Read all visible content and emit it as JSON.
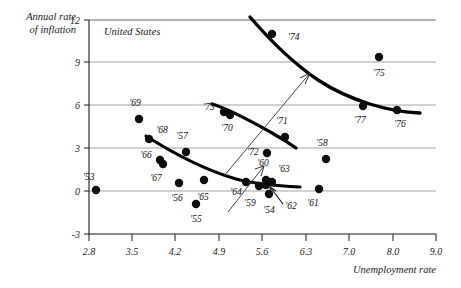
{
  "chart_data": {
    "type": "scatter",
    "title": "",
    "panel_label": "United States",
    "xlabel": "Unemployment rate",
    "ylabel_line1": "Annual rate",
    "ylabel_line2": "of inflation",
    "grid": true,
    "legend": "none",
    "ylim": [
      -3,
      12
    ],
    "yticks": [
      "12",
      "9",
      "6",
      "3",
      "0",
      "-3"
    ],
    "xticks": [
      "2.8",
      "3.5",
      "4.2",
      "4.9",
      "5.6",
      "6.3",
      "7.0",
      "8.0",
      "9.0"
    ],
    "xlim_note": "ticks evenly spaced in pixels though value steps change from 0.7 to 1.0 after 7.0",
    "point_label_key": "year",
    "points": [
      {
        "year": "'53",
        "x": 2.9,
        "y": 0.8,
        "px": 96,
        "py": 190,
        "lx": 83,
        "ly": 180,
        "anchor": "start"
      },
      {
        "year": "'54",
        "x": 5.6,
        "y": 0.5,
        "px": 269,
        "py": 194,
        "lx": 269,
        "ly": 213,
        "anchor": "middle"
      },
      {
        "year": "'55",
        "x": 4.4,
        "y": -0.4,
        "px": 196,
        "py": 204,
        "lx": 196,
        "ly": 222,
        "anchor": "middle"
      },
      {
        "year": "'56",
        "x": 4.2,
        "y": 1.5,
        "px": 179,
        "py": 183,
        "lx": 177,
        "ly": 201,
        "anchor": "middle"
      },
      {
        "year": "'57",
        "x": 4.3,
        "y": 3.3,
        "px": 186,
        "py": 152,
        "lx": 182,
        "ly": 139,
        "anchor": "middle"
      },
      {
        "year": "'58",
        "x": 6.8,
        "y": 2.7,
        "px": 326,
        "py": 159,
        "lx": 322,
        "ly": 146,
        "anchor": "middle"
      },
      {
        "year": "'59",
        "x": 5.5,
        "y": 1.0,
        "px": 259,
        "py": 186,
        "lx": 250,
        "ly": 206,
        "anchor": "middle"
      },
      {
        "year": "'60",
        "x": 5.6,
        "y": 1.6,
        "px": 266,
        "py": 180,
        "lx": 263,
        "ly": 166,
        "anchor": "middle"
      },
      {
        "year": "'61",
        "x": 6.7,
        "y": 1.0,
        "px": 319,
        "py": 189,
        "lx": 313,
        "ly": 206,
        "anchor": "middle"
      },
      {
        "year": "'62",
        "x": 5.6,
        "y": 1.1,
        "px": 266,
        "py": 185,
        "lx": 291,
        "ly": 209,
        "anchor": "middle"
      },
      {
        "year": "'63",
        "x": 5.7,
        "y": 1.5,
        "px": 272,
        "py": 182,
        "lx": 284,
        "ly": 172,
        "anchor": "middle"
      },
      {
        "year": "'64",
        "x": 5.2,
        "y": 1.4,
        "px": 246,
        "py": 182,
        "lx": 236,
        "ly": 195,
        "anchor": "middle"
      },
      {
        "year": "'65",
        "x": 4.5,
        "y": 1.6,
        "px": 204,
        "py": 180,
        "lx": 203,
        "ly": 200,
        "anchor": "middle"
      },
      {
        "year": "'66",
        "x": 3.8,
        "y": 2.9,
        "px": 160,
        "py": 160,
        "lx": 146,
        "ly": 158,
        "anchor": "middle"
      },
      {
        "year": "'67",
        "x": 3.8,
        "y": 2.6,
        "px": 163,
        "py": 164,
        "lx": 156,
        "ly": 181,
        "anchor": "middle"
      },
      {
        "year": "'68",
        "x": 3.6,
        "y": 4.3,
        "px": 149,
        "py": 139,
        "lx": 162,
        "ly": 133,
        "anchor": "middle"
      },
      {
        "year": "'69",
        "x": 3.5,
        "y": 5.5,
        "px": 139,
        "py": 119,
        "lx": 135,
        "ly": 106,
        "anchor": "middle"
      },
      {
        "year": "'70",
        "x": 4.9,
        "y": 5.8,
        "px": 230,
        "py": 115,
        "lx": 227,
        "ly": 131,
        "anchor": "middle"
      },
      {
        "year": "'71",
        "x": 5.9,
        "y": 4.3,
        "px": 285,
        "py": 137,
        "lx": 282,
        "ly": 124,
        "anchor": "middle"
      },
      {
        "year": "'72",
        "x": 5.6,
        "y": 3.3,
        "px": 267,
        "py": 153,
        "lx": 253,
        "ly": 155,
        "anchor": "middle"
      },
      {
        "year": "'73",
        "x": 4.9,
        "y": 6.2,
        "px": 224,
        "py": 112,
        "lx": 209,
        "ly": 110,
        "anchor": "middle"
      },
      {
        "year": "'74",
        "x": 5.6,
        "y": 11.0,
        "px": 272,
        "py": 34,
        "lx": 288,
        "ly": 40,
        "anchor": "start"
      },
      {
        "year": "'75",
        "x": 8.5,
        "y": 9.1,
        "px": 379,
        "py": 57,
        "lx": 379,
        "ly": 76,
        "anchor": "middle"
      },
      {
        "year": "'76",
        "x": 7.7,
        "y": 5.8,
        "px": 397,
        "py": 110,
        "lx": 400,
        "ly": 127,
        "anchor": "middle"
      },
      {
        "year": "'77",
        "x": 7.0,
        "y": 6.5,
        "px": 363,
        "py": 106,
        "lx": 360,
        "ly": 123,
        "anchor": "middle"
      }
    ],
    "annotations": [
      {
        "name": "lower-phillips-curve",
        "desc": "fitted short-run Phillips curve through 1950s-60s observations"
      },
      {
        "name": "upper-phillips-curve",
        "desc": "shifted-out Phillips curve through 1970s observations"
      },
      {
        "name": "shift-arrow",
        "desc": "arrow showing outward shift of the Phillips curve"
      }
    ]
  }
}
